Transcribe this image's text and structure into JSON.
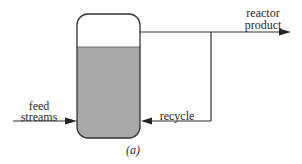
{
  "diagram": {
    "caption": "(a)",
    "vessel": {
      "name": "reactor vessel",
      "liquid_color": "#a9a9a9",
      "outline_color": "#333333"
    },
    "streams": {
      "feed": {
        "label_line1": "feed",
        "label_line2": "streams",
        "direction": "into vessel (left side)"
      },
      "product": {
        "label_line1": "reactor",
        "label_line2": "product",
        "direction": "out of vessel top to the right"
      },
      "recycle": {
        "label": "recycle",
        "direction": "from product line back into vessel (right side)"
      }
    },
    "colors": {
      "line": "#333333",
      "liquid": "#a9a9a9",
      "background": "#ffffff"
    }
  }
}
